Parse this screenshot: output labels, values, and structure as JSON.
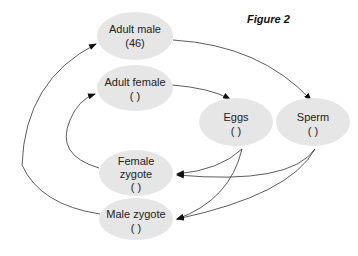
{
  "figure": {
    "title": "Figure 2",
    "nodes": [
      {
        "id": "adult_male",
        "line1": "Adult male",
        "line2": "(46)",
        "line3": ""
      },
      {
        "id": "adult_female",
        "line1": "Adult female",
        "line2": "(  )",
        "line3": ""
      },
      {
        "id": "eggs",
        "line1": "Eggs",
        "line2": "(  )",
        "line3": ""
      },
      {
        "id": "sperm",
        "line1": "Sperm",
        "line2": "(  )",
        "line3": ""
      },
      {
        "id": "female_zygote",
        "line1": "Female",
        "line2": "zygote",
        "line3": "(  )"
      },
      {
        "id": "male_zygote",
        "line1": "Male zygote",
        "line2": "(  )",
        "line3": ""
      }
    ],
    "edges": [
      {
        "from": "adult_male",
        "to": "sperm"
      },
      {
        "from": "adult_female",
        "to": "eggs"
      },
      {
        "from": "eggs",
        "to": "female_zygote"
      },
      {
        "from": "eggs",
        "to": "male_zygote"
      },
      {
        "from": "sperm",
        "to": "female_zygote"
      },
      {
        "from": "sperm",
        "to": "male_zygote"
      },
      {
        "from": "female_zygote",
        "to": "adult_female"
      },
      {
        "from": "male_zygote",
        "to": "adult_male"
      }
    ],
    "colors": {
      "node_fill": "#e6e6e6",
      "edge": "#333333"
    }
  }
}
